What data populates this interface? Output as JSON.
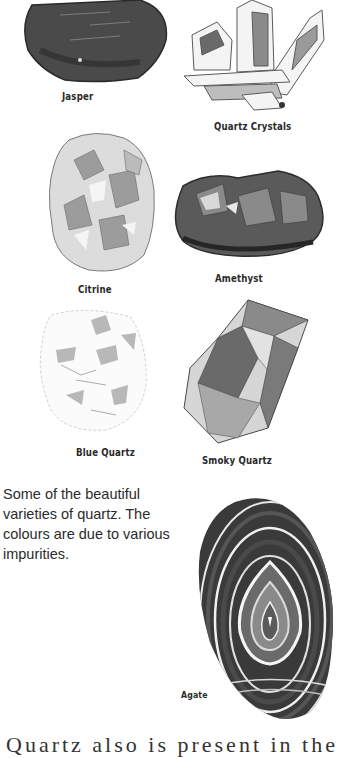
{
  "figures": [
    {
      "name": "Jasper",
      "label": "Jasper"
    },
    {
      "name": "Quartz Crystals",
      "label": "Quartz Crystals"
    },
    {
      "name": "Citrine",
      "label": "Citrine"
    },
    {
      "name": "Amethyst",
      "label": "Amethyst"
    },
    {
      "name": "Blue Quartz",
      "label": "Blue Quartz"
    },
    {
      "name": "Smoky Quartz",
      "label": "Smoky Quartz"
    },
    {
      "name": "Agate",
      "label": "Agate"
    }
  ],
  "caption": {
    "text": "Some of the beautiful varieties of quartz. The colours are due to various impurities."
  },
  "cut_off_line": {
    "text": "Quartz  also  is  present  in  the"
  },
  "colors": {
    "background": "#ffffff",
    "ink_dark": "#2a2a2a",
    "ink_mid": "#7a7a7a",
    "ink_light": "#c8c8c8"
  }
}
